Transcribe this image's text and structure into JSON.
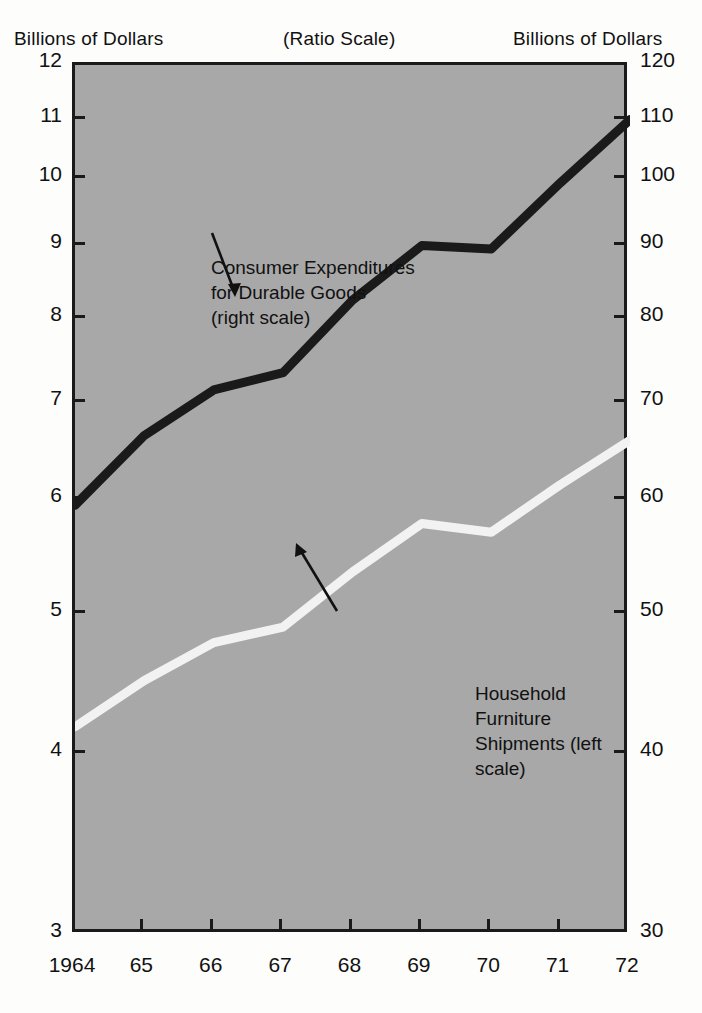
{
  "header": {
    "left_label": "Billions of Dollars",
    "center_label": "(Ratio Scale)",
    "right_label": "Billions of Dollars"
  },
  "colors": {
    "plot_background": "#a8a8a8",
    "frame": "#1a1a1a",
    "dark_series": "#1a1a1a",
    "light_series": "#f2f2f2",
    "page_background": "#fdfdfc"
  },
  "annotations": [
    {
      "id": "consumer-expenditures",
      "text": "Consumer Expenditures\nfor Durable Goods\n(right scale)"
    },
    {
      "id": "household-furniture",
      "text": "Household Furniture\nShipments (left scale)"
    }
  ],
  "chart_data": {
    "type": "line",
    "title": "",
    "subtitle": "(Ratio Scale)",
    "xlabel": "",
    "ylabel": "Billions of Dollars",
    "y2label": "Billions of Dollars",
    "scale": "log",
    "grid": false,
    "legend": "annotated-inline",
    "x": [
      1964,
      1965,
      1966,
      1967,
      1968,
      1969,
      1970,
      1971,
      1972
    ],
    "xtick_labels": [
      "1964",
      "65",
      "66",
      "67",
      "68",
      "69",
      "70",
      "71",
      "72"
    ],
    "ylim": [
      3,
      12
    ],
    "ytick_labels": [
      "3",
      "4",
      "5",
      "6",
      "7",
      "8",
      "9",
      "10",
      "11",
      "12"
    ],
    "ytick_values": [
      3,
      4,
      5,
      6,
      7,
      8,
      9,
      10,
      11,
      12
    ],
    "y2lim": [
      30,
      120
    ],
    "y2tick_labels": [
      "30",
      "40",
      "50",
      "60",
      "70",
      "80",
      "90",
      "100",
      "110",
      "120"
    ],
    "y2tick_values": [
      30,
      40,
      50,
      60,
      70,
      80,
      90,
      100,
      110,
      120
    ],
    "series": [
      {
        "name": "Consumer Expenditures for Durable Goods (right scale)",
        "axis": "right",
        "color": "#1a1a1a",
        "values": [
          59.5,
          66.5,
          71.5,
          73.5,
          82.5,
          90.0,
          89.5,
          99.5,
          110.0
        ]
      },
      {
        "name": "Household Furniture Shipments (left scale)",
        "axis": "left",
        "color": "#f2f2f2",
        "values": [
          4.18,
          4.5,
          4.78,
          4.9,
          5.35,
          5.78,
          5.7,
          6.15,
          6.6
        ]
      }
    ]
  }
}
